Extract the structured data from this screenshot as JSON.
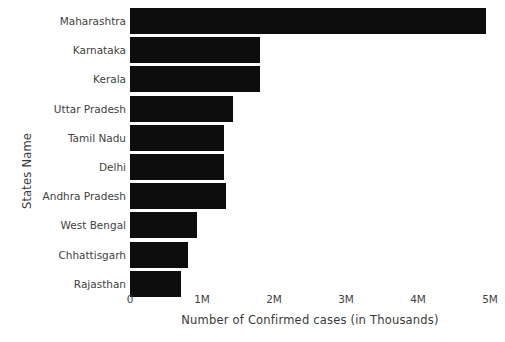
{
  "chart_data": {
    "type": "bar",
    "orientation": "horizontal",
    "title": "",
    "xlabel": "Number of Confirmed cases (in Thousands)",
    "ylabel": "States Name",
    "categories": [
      "Maharashtra",
      "Karnataka",
      "Kerala",
      "Uttar Pradesh",
      "Tamil Nadu",
      "Delhi",
      "Andhra Pradesh",
      "West Bengal",
      "Chhattisgarh",
      "Rajasthan"
    ],
    "values": [
      4950000,
      1800000,
      1800000,
      1430000,
      1310000,
      1300000,
      1340000,
      930000,
      800000,
      710000
    ],
    "xlim": [
      0,
      5000000
    ],
    "xticks": [
      0,
      1000000,
      2000000,
      3000000,
      4000000,
      5000000
    ],
    "xtick_labels": [
      "0",
      "1M",
      "2M",
      "3M",
      "4M",
      "5M"
    ],
    "grid": false,
    "legend": null,
    "bar_color": "#0d0d0d",
    "background_color": "#ffffff"
  }
}
